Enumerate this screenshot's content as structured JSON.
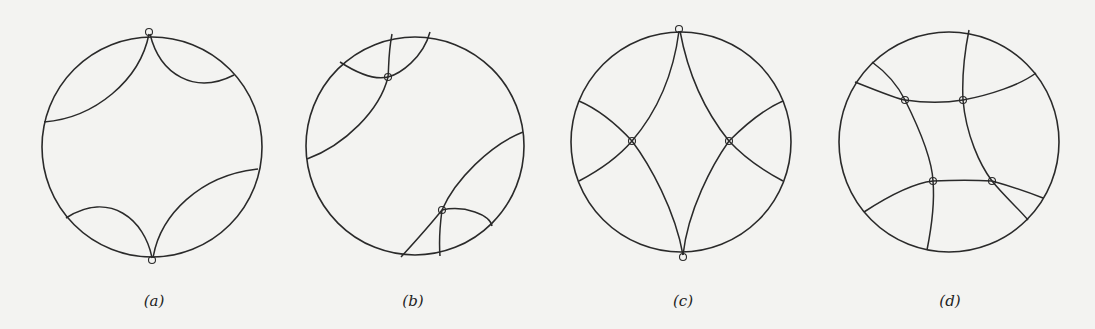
{
  "figure": {
    "panels": [
      {
        "id": "a",
        "caption": "(a)",
        "center": [
          152,
          147
        ],
        "radius": 110,
        "marked_points": 2
      },
      {
        "id": "b",
        "caption": "(b)",
        "center": [
          415,
          146
        ],
        "radius": 109,
        "marked_points": 2
      },
      {
        "id": "c",
        "caption": "(c)",
        "center": [
          681,
          142
        ],
        "radius": 110,
        "marked_points": 4
      },
      {
        "id": "d",
        "caption": "(d)",
        "center": [
          949,
          142
        ],
        "radius": 110,
        "marked_points": 4
      }
    ],
    "colors": {
      "background": "#f3f3f1",
      "ink": "#2a2a2a"
    }
  }
}
